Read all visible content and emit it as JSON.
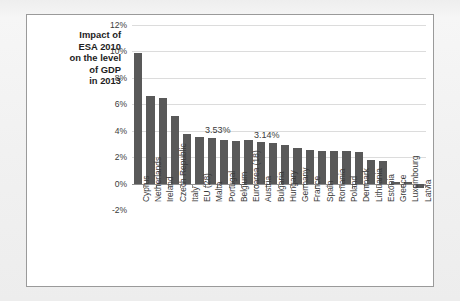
{
  "chart_data": {
    "type": "bar",
    "title_lines": [
      "Impact of",
      "ESA 2010",
      "on the level",
      "of GDP",
      "in 2013"
    ],
    "xlabel": "",
    "ylabel": "",
    "ylim": [
      -2,
      12
    ],
    "ytick_labels": [
      "12%",
      "10%",
      "8%",
      "6%",
      "4%",
      "2%",
      "0%",
      "-2%"
    ],
    "ytick_values": [
      12,
      10,
      8,
      6,
      4,
      2,
      0,
      -2
    ],
    "grid": true,
    "legend": "none",
    "bar_color": "#595959",
    "gridline_color": "#dcdcdc",
    "axis_color": "#8f8f8f",
    "categories": [
      "Cyprus",
      "Netherlands",
      "Ireland",
      "Czech Republic",
      "Italy",
      "EU (28)",
      "Malta",
      "Portugal",
      "Belgium",
      "Euroarea (18)",
      "Austria",
      "Bulgaria",
      "Hungary",
      "Germany",
      "France",
      "Spain",
      "Romania",
      "Poland",
      "Denmark",
      "Lithuania",
      "Estonia",
      "Greece",
      "Luxembourg",
      "Latvia"
    ],
    "values": [
      9.85,
      6.65,
      6.5,
      5.1,
      3.75,
      3.53,
      3.45,
      3.3,
      3.25,
      3.3,
      3.14,
      3.05,
      2.95,
      2.7,
      2.55,
      2.5,
      2.45,
      2.45,
      2.4,
      1.8,
      1.7,
      1.55,
      0.9,
      0.45
    ],
    "annotations": [
      {
        "text": "3.53%",
        "category": "EU (28)",
        "value": 3.53
      },
      {
        "text": "3.14%",
        "category": "Euroarea (18)",
        "value": 3.14
      }
    ],
    "trailing_near_zero": [
      {
        "label": "Greece",
        "value": 0.12
      },
      {
        "label": "Luxembourg",
        "value": 0.1
      },
      {
        "label": "Latvia",
        "value": -0.35
      }
    ]
  }
}
